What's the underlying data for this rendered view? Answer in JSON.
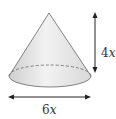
{
  "figure": {
    "shape": "cone",
    "height_label_coef": "4",
    "height_label_var": "x",
    "diameter_label_coef": "6",
    "diameter_label_var": "x",
    "colors": {
      "fill": "#e6e6e6",
      "stroke": "#555555",
      "arrow": "#222222"
    }
  }
}
